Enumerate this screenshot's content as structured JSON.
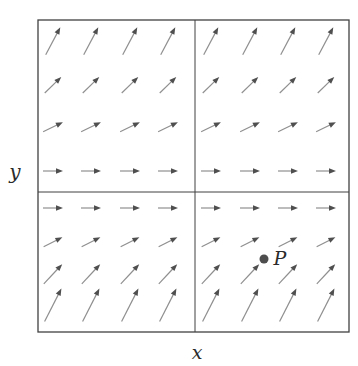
{
  "figure": {
    "background": "#ffffff",
    "border_color": "#414141",
    "arrow_shaft_color": "#8f8f8f",
    "arrow_head_color": "#4f4f4f",
    "point_color": "#4d4d4d",
    "label_color": "#2b2b2b"
  },
  "labels": {
    "x_axis": "x",
    "y_axis": "y",
    "point": "P"
  },
  "chart_data": {
    "type": "vector-field-diagram",
    "box_px": {
      "left": 38,
      "top": 20,
      "right": 349,
      "bottom": 332
    },
    "center_lines_px": {
      "vertical_x": 195,
      "horizontal_y": 192
    },
    "grid_columns_x_px": [
      53,
      91,
      130,
      168,
      211,
      250,
      288,
      326
    ],
    "grid_rows": [
      {
        "y_px": 41,
        "angle_deg": 62,
        "length_px": 31
      },
      {
        "y_px": 85,
        "angle_deg": 44,
        "length_px": 23
      },
      {
        "y_px": 127,
        "angle_deg": 26,
        "length_px": 22
      },
      {
        "y_px": 171,
        "angle_deg": 0,
        "length_px": 20
      },
      {
        "y_px": 208,
        "angle_deg": 0,
        "length_px": 20
      },
      {
        "y_px": 242,
        "angle_deg": 27,
        "length_px": 21
      },
      {
        "y_px": 274,
        "angle_deg": 47,
        "length_px": 27
      },
      {
        "y_px": 305,
        "angle_deg": 63,
        "length_px": 37
      }
    ],
    "arrow_direction": "all arrows point up-right; slope magnitude increases with distance from the horizontal center line",
    "point_P_px": {
      "x": 264,
      "y": 259,
      "radius": 4.5
    },
    "label_positions_px": {
      "x_axis": {
        "x": 197,
        "y": 352
      },
      "y_axis": {
        "x": 15,
        "y": 172
      },
      "point": {
        "x": 280,
        "y": 258
      }
    }
  }
}
